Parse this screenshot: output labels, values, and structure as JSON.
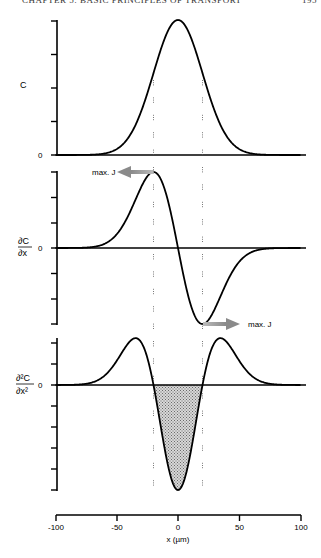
{
  "page": {
    "running_header": "CHAPTER 5: BASIC PRINCIPLES OF TRANSPORT",
    "page_number": "195"
  },
  "figure": {
    "x_axis": {
      "label": "x (µm)",
      "ticks": [
        "-100",
        "-50",
        "0",
        "50",
        "100"
      ]
    },
    "panels": [
      {
        "id": "concentration",
        "ylabel": "C",
        "zero_label": "0"
      },
      {
        "id": "first-derivative",
        "ylabel_num": "∂C",
        "ylabel_den": "∂x",
        "zero_label": "0",
        "annotations": [
          "max. J",
          "max. J"
        ]
      },
      {
        "id": "second-derivative",
        "ylabel_num": "∂²C",
        "ylabel_den": "∂x²",
        "zero_label": "0"
      }
    ]
  },
  "chart_data": [
    {
      "type": "line",
      "title": "Concentration profile",
      "xlabel": "x (µm)",
      "ylabel": "C",
      "xlim": [
        -100,
        100
      ],
      "ylim": [
        0,
        1
      ],
      "grid": false,
      "x": [
        -100,
        -80,
        -60,
        -40,
        -30,
        -20,
        -10,
        0,
        10,
        20,
        30,
        40,
        60,
        80,
        100
      ],
      "values": [
        0.0,
        0.0003,
        0.011,
        0.135,
        0.325,
        0.607,
        0.882,
        1.0,
        0.882,
        0.607,
        0.325,
        0.135,
        0.011,
        0.0003,
        0.0
      ],
      "reference_lines": {
        "vertical_dashed_x": [
          -20,
          20
        ]
      }
    },
    {
      "type": "line",
      "title": "First derivative (flux proportional)",
      "xlabel": "x (µm)",
      "ylabel": "∂C/∂x",
      "xlim": [
        -100,
        100
      ],
      "ylim": [
        -1,
        1
      ],
      "grid": false,
      "x": [
        -100,
        -80,
        -60,
        -40,
        -30,
        -20,
        -10,
        0,
        10,
        20,
        30,
        40,
        60,
        80,
        100
      ],
      "values": [
        0.0,
        0.002,
        0.045,
        0.366,
        0.806,
        1.0,
        0.727,
        0.0,
        -0.727,
        -1.0,
        -0.806,
        -0.366,
        -0.045,
        -0.002,
        0.0
      ],
      "annotations": [
        {
          "text": "max. J",
          "x": -20,
          "direction": "left"
        },
        {
          "text": "max. J",
          "x": 20,
          "direction": "right"
        }
      ],
      "reference_lines": {
        "vertical_dashed_x": [
          -20,
          20
        ]
      }
    },
    {
      "type": "area",
      "title": "Second derivative",
      "xlabel": "x (µm)",
      "ylabel": "∂²C/∂x²",
      "xlim": [
        -100,
        100
      ],
      "ylim": [
        -1,
        0.5
      ],
      "grid": false,
      "x": [
        -100,
        -80,
        -60,
        -50,
        -40,
        -34.6,
        -30,
        -20,
        -10,
        0,
        10,
        20,
        30,
        34.6,
        40,
        50,
        60,
        80,
        100
      ],
      "values": [
        0.0,
        0.004,
        0.089,
        0.229,
        0.406,
        0.446,
        0.406,
        0.0,
        -0.661,
        -1.0,
        -0.661,
        0.0,
        0.406,
        0.446,
        0.406,
        0.229,
        0.089,
        0.004,
        0.0
      ],
      "shaded_region": {
        "from_x": -20,
        "to_x": 20,
        "description": "negative region shaded"
      },
      "reference_lines": {
        "vertical_dashed_x": [
          -20,
          20
        ]
      }
    }
  ]
}
